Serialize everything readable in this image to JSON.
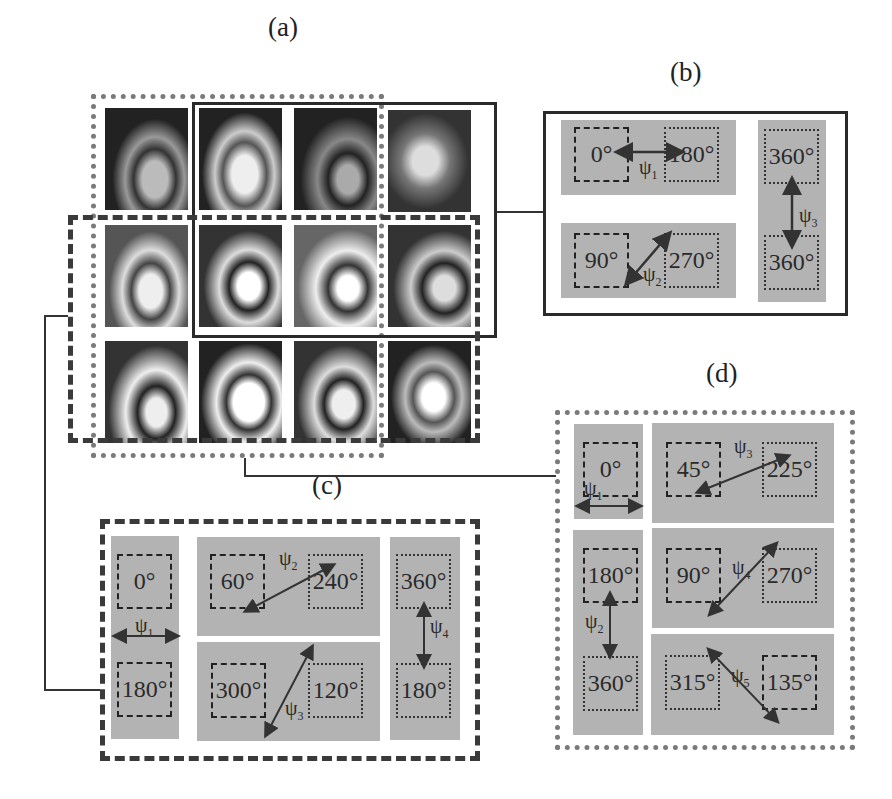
{
  "figure": {
    "panel_labels": {
      "a": "(a)",
      "b": "(b)",
      "c": "(c)",
      "d": "(d)"
    },
    "image_grid": {
      "rows": 3,
      "cols": 4,
      "description": "grayscale fringe pattern images"
    },
    "panel_b": {
      "groups": [
        {
          "left": "0°",
          "right": "180°",
          "psi": "ψ",
          "psi_sub": "1"
        },
        {
          "left": "90°",
          "right": "270°",
          "psi": "ψ",
          "psi_sub": "2"
        },
        {
          "top": "360°",
          "bottom": "360°",
          "psi": "ψ",
          "psi_sub": "3"
        }
      ]
    },
    "panel_c": {
      "groups": [
        {
          "top": "0°",
          "bottom": "180°",
          "psi": "ψ",
          "psi_sub": "1"
        },
        {
          "left": "60°",
          "right": "240°",
          "psi": "ψ",
          "psi_sub": "2"
        },
        {
          "left": "300°",
          "right": "120°",
          "psi": "ψ",
          "psi_sub": "3"
        },
        {
          "top": "360°",
          "bottom": "180°",
          "psi": "ψ",
          "psi_sub": "4"
        }
      ]
    },
    "panel_d": {
      "groups": [
        {
          "single": "0°",
          "psi": "ψ",
          "psi_sub": "1"
        },
        {
          "top": "180°",
          "bottom": "360°",
          "psi": "ψ",
          "psi_sub": "2"
        },
        {
          "left": "45°",
          "right": "225°",
          "psi": "ψ",
          "psi_sub": "3"
        },
        {
          "left": "90°",
          "right": "270°",
          "psi": "ψ",
          "psi_sub": "4"
        },
        {
          "left": "315°",
          "right": "135°",
          "psi": "ψ",
          "psi_sub": "5"
        }
      ]
    },
    "colors": {
      "panel_gray": "#b3b3b3",
      "dotted_border": "#7a7a7a",
      "dashed_border": "#3a3a3a",
      "solid_border": "#2a2a2a"
    }
  }
}
